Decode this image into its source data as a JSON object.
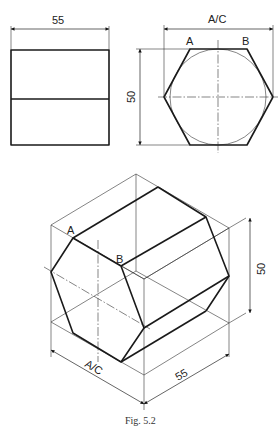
{
  "figure": {
    "caption": "Fig. 5.2",
    "front_view": {
      "width_label": "55"
    },
    "end_view": {
      "across_corners_label": "A/C",
      "height_label": "50",
      "vertex_a": "A",
      "vertex_b": "B"
    },
    "isometric_view": {
      "vertex_a": "A",
      "vertex_b": "B",
      "height_label": "50",
      "length_label": "55",
      "across_corners_label": "A/C"
    }
  }
}
